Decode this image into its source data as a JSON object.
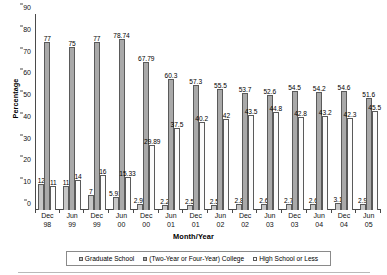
{
  "chart_data": {
    "type": "bar",
    "title": "",
    "xlabel": "Month/Year",
    "ylabel": "Percentage",
    "ylim": [
      0,
      90
    ],
    "yticks": [
      0,
      10,
      20,
      30,
      40,
      50,
      60,
      70,
      80,
      90
    ],
    "grid": false,
    "legend_position": "bottom",
    "categories": [
      "Dec 98",
      "Jun 99",
      "Dec 99",
      "Jun 00",
      "Dec 00",
      "Jun 01",
      "Dec 01",
      "Jun 02",
      "Dec 02",
      "Jun 03",
      "Dec 03",
      "Jun 04",
      "Dec 04",
      "Jun 05"
    ],
    "category_lines": [
      {
        "l1": "Dec",
        "l2": "98"
      },
      {
        "l1": "Jun",
        "l2": "99"
      },
      {
        "l1": "Dec",
        "l2": "99"
      },
      {
        "l1": "Jun",
        "l2": "00"
      },
      {
        "l1": "Dec",
        "l2": "00"
      },
      {
        "l1": "Jun",
        "l2": "01"
      },
      {
        "l1": "Dec",
        "l2": "01"
      },
      {
        "l1": "Jun",
        "l2": "02"
      },
      {
        "l1": "Dec",
        "l2": "02"
      },
      {
        "l1": "Jun",
        "l2": "03"
      },
      {
        "l1": "Dec",
        "l2": "03"
      },
      {
        "l1": "Jun",
        "l2": "04"
      },
      {
        "l1": "Dec",
        "l2": "04"
      },
      {
        "l1": "Jun",
        "l2": "05"
      }
    ],
    "series": [
      {
        "name": "Graduate School",
        "color": "#c6c6c6",
        "values": [
          12,
          11,
          7,
          5.93,
          2.92,
          2.2,
          2.5,
          2.5,
          2.8,
          2.6,
          2.7,
          2.6,
          3.1,
          2.9
        ],
        "labels": [
          "12",
          "11",
          "7",
          "5.93",
          "2.92",
          "2.2",
          "2.5",
          "2.5",
          "2.8",
          "2.6",
          "2.7",
          "2.6",
          "3.1",
          "2.9"
        ]
      },
      {
        "name": "(Two-Year or Four-Year) College",
        "color": "#a9a9a9",
        "values": [
          77,
          75,
          77,
          78.74,
          67.79,
          60.3,
          57.3,
          55.5,
          53.7,
          52.6,
          54.5,
          54.2,
          54.6,
          51.6
        ],
        "labels": [
          "77",
          "75",
          "77",
          "78.74",
          "67.79",
          "60.3",
          "57.3",
          "55.5",
          "53.7",
          "52.6",
          "54.5",
          "54.2",
          "54.6",
          "51.6"
        ]
      },
      {
        "name": "High School or Less",
        "color": "#fbfbfb",
        "values": [
          11,
          14,
          16,
          15.33,
          29.89,
          37.5,
          40.2,
          42,
          43.5,
          44.8,
          42.8,
          43.2,
          42.3,
          45.5
        ],
        "labels": [
          "11",
          "14",
          "16",
          "15.33",
          "29.89",
          "37.5",
          "40.2",
          "42",
          "43.5",
          "44.8",
          "42.8",
          "43.2",
          "42.3",
          "45.5"
        ]
      }
    ]
  }
}
